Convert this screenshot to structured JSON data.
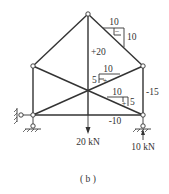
{
  "figure": {
    "caption": "( b )",
    "type": "truss internal force diagram"
  },
  "loads": {
    "center_load": "20 kN",
    "support_reaction": "10 kN"
  },
  "member_forces": {
    "center_vertical": "+20",
    "right_vertical": "-15",
    "bottom_chord": "-10"
  },
  "slope_triangles": {
    "top_right": {
      "horizontal": "10",
      "vertical": "10",
      "sign": "−"
    },
    "upper_diagonal": {
      "horizontal": "10",
      "vertical": "5",
      "sign": "+"
    },
    "lower_diagonal": {
      "horizontal": "10",
      "vertical": "5",
      "sign": "+"
    }
  },
  "colors": {
    "line": "#333333",
    "background": "#ffffff"
  }
}
